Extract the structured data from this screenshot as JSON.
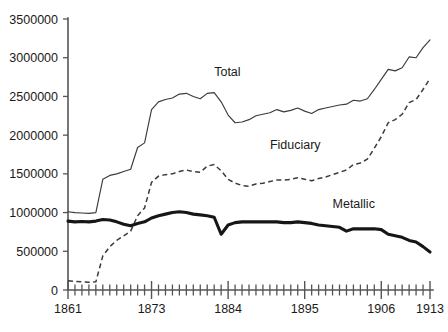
{
  "chart_data": {
    "type": "line",
    "title": "",
    "xlabel": "",
    "ylabel": "",
    "xlim": [
      1861,
      1913
    ],
    "ylim": [
      0,
      3500000
    ],
    "grid": false,
    "legend_position": "inline-annotations",
    "y_ticks": [
      0,
      500000,
      1000000,
      1500000,
      2000000,
      2500000,
      3000000,
      3500000
    ],
    "y_tick_labels": [
      "0",
      "500000",
      "1000000",
      "1500000",
      "2000000",
      "2500000",
      "3000000",
      "3500000"
    ],
    "x_ticks_labeled": [
      1861,
      1873,
      1884,
      1895,
      1906,
      1913
    ],
    "x_tick_labels": [
      "1861",
      "1873",
      "1884",
      "1895",
      "1906",
      "1913"
    ],
    "x_minor_tick_step": 1,
    "x": [
      1861,
      1862,
      1863,
      1864,
      1865,
      1866,
      1867,
      1868,
      1869,
      1870,
      1871,
      1872,
      1873,
      1874,
      1875,
      1876,
      1877,
      1878,
      1879,
      1880,
      1881,
      1882,
      1883,
      1884,
      1885,
      1886,
      1887,
      1888,
      1889,
      1890,
      1891,
      1892,
      1893,
      1894,
      1895,
      1896,
      1897,
      1898,
      1899,
      1900,
      1901,
      1902,
      1903,
      1904,
      1905,
      1906,
      1907,
      1908,
      1909,
      1910,
      1911,
      1912,
      1913
    ],
    "series": [
      {
        "name": "Total",
        "style": "thin-solid",
        "values": [
          1010000,
          1000000,
          995000,
          990000,
          1000000,
          1430000,
          1480000,
          1500000,
          1530000,
          1560000,
          1840000,
          1900000,
          2330000,
          2430000,
          2460000,
          2480000,
          2530000,
          2540000,
          2500000,
          2470000,
          2540000,
          2550000,
          2430000,
          2260000,
          2160000,
          2170000,
          2200000,
          2250000,
          2270000,
          2290000,
          2330000,
          2300000,
          2320000,
          2350000,
          2310000,
          2280000,
          2330000,
          2350000,
          2370000,
          2390000,
          2400000,
          2450000,
          2440000,
          2470000,
          2590000,
          2720000,
          2850000,
          2830000,
          2870000,
          3010000,
          3000000,
          3130000,
          3230000
        ]
      },
      {
        "name": "Fiduciary",
        "style": "dashed",
        "values": [
          120000,
          110000,
          105000,
          100000,
          105000,
          440000,
          560000,
          640000,
          700000,
          760000,
          960000,
          1060000,
          1390000,
          1470000,
          1490000,
          1500000,
          1530000,
          1550000,
          1530000,
          1520000,
          1600000,
          1620000,
          1540000,
          1430000,
          1380000,
          1350000,
          1340000,
          1370000,
          1380000,
          1400000,
          1420000,
          1420000,
          1430000,
          1450000,
          1430000,
          1410000,
          1440000,
          1460000,
          1490000,
          1520000,
          1550000,
          1620000,
          1640000,
          1690000,
          1830000,
          1980000,
          2160000,
          2200000,
          2270000,
          2420000,
          2460000,
          2590000,
          2730000
        ]
      },
      {
        "name": "Metallic",
        "style": "thick-solid",
        "values": [
          890000,
          880000,
          885000,
          880000,
          890000,
          910000,
          905000,
          880000,
          850000,
          830000,
          860000,
          880000,
          930000,
          960000,
          980000,
          1000000,
          1010000,
          1000000,
          980000,
          970000,
          960000,
          940000,
          720000,
          840000,
          870000,
          880000,
          880000,
          880000,
          880000,
          880000,
          880000,
          870000,
          870000,
          880000,
          870000,
          860000,
          840000,
          830000,
          820000,
          810000,
          760000,
          790000,
          790000,
          790000,
          790000,
          780000,
          720000,
          700000,
          680000,
          640000,
          620000,
          560000,
          490000
        ]
      }
    ],
    "annotations": [
      {
        "text": "Total",
        "x": 1882,
        "y": 2760000
      },
      {
        "text": "Fiduciary",
        "x": 1890,
        "y": 1820000
      },
      {
        "text": "Metallic",
        "x": 1899,
        "y": 1060000
      }
    ]
  }
}
